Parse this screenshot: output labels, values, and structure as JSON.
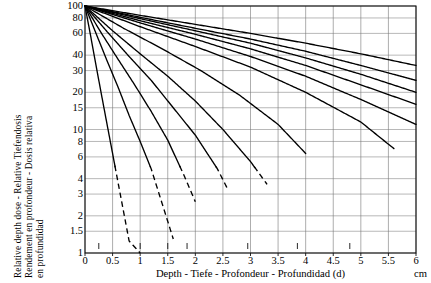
{
  "chart_data": {
    "type": "line",
    "title": "",
    "xlabel": "Depth - Tiefe - Profondeur - Profundidad (d)",
    "ylabel": "Relative depth dose - Relative Tiefendosis Rendement en profondeur - Dosis relativa en profundidad",
    "x_unit": "cm",
    "xlim": [
      0,
      6
    ],
    "ylim": [
      1,
      100
    ],
    "yscale": "log",
    "grid": true,
    "legend_position": "top-right",
    "xticks": [
      "0",
      "0.5",
      "1",
      "1.5",
      "2",
      "2.5",
      "3",
      "3.5",
      "4",
      "4.5",
      "5",
      "5.5",
      "6"
    ],
    "xtick_values": [
      0,
      0.5,
      1,
      1.5,
      2,
      2.5,
      3,
      3.5,
      4,
      4.5,
      5,
      5.5,
      6
    ],
    "yticks": [
      "100",
      "80",
      "60",
      "40",
      "30",
      "20",
      "15",
      "10",
      "8",
      "6",
      "4",
      "3",
      "2",
      "1.5",
      "1"
    ],
    "ytick_values": [
      100,
      80,
      60,
      40,
      30,
      20,
      15,
      10,
      8,
      6,
      4,
      3,
      2,
      1.5,
      1
    ],
    "series_legend_title": "mm Al",
    "series": [
      {
        "name": "0.02",
        "hvl_mm_al": 0.02,
        "label_position": "inline-bottom",
        "x": [
          0,
          0.1,
          0.2,
          0.3,
          0.4,
          0.5,
          0.6,
          0.8,
          1.0
        ],
        "values": [
          100,
          58,
          33,
          19,
          11,
          6.4,
          3.7,
          1.25,
          1.0
        ]
      },
      {
        "name": "0.04",
        "hvl_mm_al": 0.04,
        "label_position": "inline-bottom",
        "x": [
          0,
          0.2,
          0.4,
          0.6,
          0.8,
          1.0,
          1.2,
          1.4,
          1.6
        ],
        "values": [
          100,
          60,
          36,
          22,
          13,
          8.0,
          4.8,
          2.5,
          1.3
        ]
      },
      {
        "name": "0.06",
        "hvl_mm_al": 0.06,
        "label_position": "inline-bottom",
        "x": [
          0,
          0.3,
          0.6,
          0.9,
          1.2,
          1.5,
          1.8,
          2.0
        ],
        "values": [
          100,
          60,
          37,
          23,
          14,
          8.2,
          4.2,
          2.6
        ]
      },
      {
        "name": "0.08",
        "hvl_mm_al": 0.08,
        "label_position": "inline-bottom",
        "x": [
          0,
          0.4,
          0.8,
          1.2,
          1.6,
          2.0,
          2.4,
          2.6
        ],
        "values": [
          100,
          62,
          39,
          25,
          15,
          9.0,
          4.8,
          3.2
        ]
      },
      {
        "name": "0.1",
        "hvl_mm_al": 0.1,
        "label_position": "inline-bottom",
        "x": [
          0,
          0.5,
          1.0,
          1.5,
          2.0,
          2.5,
          3.0,
          3.3
        ],
        "values": [
          100,
          63,
          41,
          27,
          17,
          10.0,
          5.5,
          3.6
        ]
      },
      {
        "name": "0.15",
        "hvl_mm_al": 0.15,
        "label_position": "inline-bottom",
        "x": [
          0,
          0.7,
          1.4,
          2.1,
          2.8,
          3.5,
          4.0
        ],
        "values": [
          100,
          66,
          45,
          30,
          19,
          11.0,
          6.4
        ]
      },
      {
        "name": "0.2",
        "hvl_mm_al": 0.2,
        "label_position": "inline-bottom",
        "x": [
          0,
          1.0,
          2.0,
          3.0,
          4.0,
          5.0,
          5.6
        ],
        "values": [
          100,
          68,
          47,
          32,
          20,
          11.5,
          7.0
        ]
      },
      {
        "name": "0.3",
        "hvl_mm_al": 0.3,
        "label_position": "right-edge",
        "x": [
          0,
          1.0,
          2.0,
          3.0,
          4.0,
          5.0,
          6.0
        ],
        "values": [
          100,
          73,
          54,
          39,
          27,
          17.5,
          11.0
        ]
      },
      {
        "name": "0.4",
        "hvl_mm_al": 0.4,
        "label_position": "right-edge",
        "x": [
          0,
          1.0,
          2.0,
          3.0,
          4.0,
          5.0,
          6.0
        ],
        "values": [
          100,
          76,
          59,
          45,
          33,
          23,
          16.0
        ]
      },
      {
        "name": "0.5",
        "hvl_mm_al": 0.5,
        "label_position": "right-edge",
        "x": [
          0,
          1.0,
          2.0,
          3.0,
          4.0,
          5.0,
          6.0
        ],
        "values": [
          100,
          79,
          63,
          50,
          38,
          28,
          20.0
        ]
      },
      {
        "name": "0.6",
        "hvl_mm_al": 0.6,
        "label_position": "right-edge",
        "x": [
          0,
          1.0,
          2.0,
          3.0,
          4.0,
          5.0,
          6.0
        ],
        "values": [
          100,
          81,
          66,
          54,
          43,
          33,
          25.0
        ]
      },
      {
        "name": "0.8",
        "hvl_mm_al": 0.8,
        "label_position": "right-edge",
        "x": [
          0,
          1.0,
          2.0,
          3.0,
          4.0,
          5.0,
          6.0
        ],
        "values": [
          100,
          84,
          71,
          60,
          50,
          41,
          33.0
        ]
      }
    ],
    "annotations": [
      {
        "text": "HVL - HWSD",
        "position": "upper-right"
      },
      {
        "text": "CDA - CHR",
        "position": "upper-right"
      },
      {
        "text": "mm Al",
        "position": "right-column-header"
      }
    ]
  },
  "axis": {
    "y_title_line1": "Relative depth dose - Relative Tiefendosis",
    "y_title_line2": "Rendement en profondeur - Dosis relativa",
    "y_title_line3": "en profundidad",
    "x_title": "Depth - Tiefe - Profondeur - Profundidad (d)",
    "x_unit": "cm"
  },
  "legend": {
    "line1": "HVL - HWSD",
    "line2": "CDA - CHR",
    "units": "mm Al"
  },
  "inline_labels": [
    "0.02",
    "0.04",
    "0.06",
    "0.08",
    "0.1",
    "0.15",
    "0.2"
  ],
  "right_labels": [
    "0.8",
    "0.6",
    "0.5",
    "0.4",
    "0.3"
  ],
  "colors": {
    "curve": "#000000",
    "grid": "#888888",
    "frame": "#111111",
    "background": "#ffffff"
  }
}
